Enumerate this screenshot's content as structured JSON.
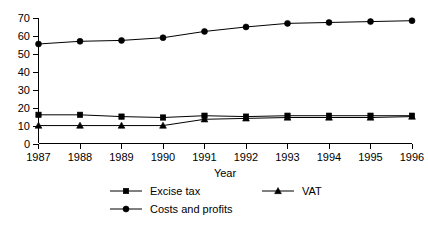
{
  "chart_data": {
    "type": "line",
    "title": "",
    "xlabel": "Year",
    "ylabel": "",
    "categories": [
      "1987",
      "1988",
      "1989",
      "1990",
      "1991",
      "1992",
      "1993",
      "1994",
      "1995",
      "1996"
    ],
    "x": [
      1987,
      1988,
      1989,
      1990,
      1991,
      1992,
      1993,
      1994,
      1995,
      1996
    ],
    "xlim": [
      1987,
      1996
    ],
    "ylim": [
      0,
      70
    ],
    "yticks": [
      0,
      10,
      20,
      30,
      40,
      50,
      60,
      70
    ],
    "ytick_labels": [
      "0",
      "10",
      "20",
      "30",
      "40",
      "50",
      "60",
      "70"
    ],
    "grid": false,
    "legend_position": "bottom",
    "series": [
      {
        "name": "Excise tax",
        "marker": "square",
        "color": "#000000",
        "values": [
          16,
          16,
          15,
          14.5,
          15.5,
          15,
          15.5,
          15.5,
          15.5,
          15.5
        ]
      },
      {
        "name": "VAT",
        "marker": "triangle",
        "color": "#000000",
        "values": [
          10,
          10,
          10,
          10,
          13.5,
          14,
          14.5,
          14.5,
          14.5,
          15
        ]
      },
      {
        "name": "Costs and profits",
        "marker": "circle",
        "color": "#000000",
        "values": [
          55.5,
          57,
          57.5,
          59,
          62.5,
          65,
          67,
          67.5,
          68,
          68.5
        ]
      }
    ]
  },
  "legend": {
    "items": [
      {
        "label": "Excise tax",
        "marker": "square"
      },
      {
        "label": "VAT",
        "marker": "triangle"
      },
      {
        "label": "Costs and profits",
        "marker": "circle"
      }
    ]
  },
  "axes": {
    "x_title": "Year"
  }
}
